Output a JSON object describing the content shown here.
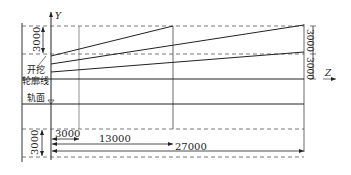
{
  "diagram": {
    "type": "excavation-profile",
    "axes": {
      "vertical": "Y",
      "horizontal": "Z"
    },
    "labels": {
      "excavation_line_1": "开挖",
      "excavation_line_2": "轮廓线",
      "rail_surface": "轨面"
    },
    "dimensions": {
      "left_top_vertical": "3000",
      "left_bottom_vertical": "3000",
      "right_upper_vertical": "3000",
      "right_lower_vertical": "3000",
      "horizontal_short": "3000",
      "horizontal_mid": "13000",
      "horizontal_long": "27000"
    },
    "colors": {
      "line": "#222222",
      "dashed": "#555555",
      "background": "#ffffff"
    }
  }
}
